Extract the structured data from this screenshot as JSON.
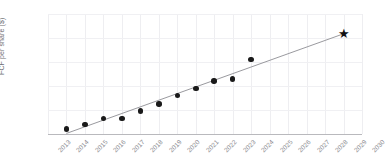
{
  "chart_data": {
    "type": "scatter",
    "title": "",
    "xlabel": "",
    "ylabel": "FCF per share ($)",
    "xlim": [
      2013,
      2030
    ],
    "ylim": [
      0,
      10
    ],
    "grid": true,
    "legend": false,
    "xticks": [
      "2013",
      "2014",
      "2015",
      "2016",
      "2017",
      "2018",
      "2019",
      "2020",
      "2021",
      "2022",
      "2023",
      "2024",
      "2025",
      "2026",
      "2027",
      "2028",
      "2029",
      "2030"
    ],
    "yticks": [
      "0",
      "2",
      "4",
      "6",
      "8",
      "10"
    ],
    "ytick_values": [
      0,
      2,
      4,
      6,
      8,
      10
    ],
    "series": [
      {
        "name": "Historical FCF per share",
        "marker": "circle",
        "color": "#1a1a1a",
        "x": [
          2014,
          2015,
          2016,
          2017,
          2018,
          2019,
          2020,
          2021,
          2022,
          2023,
          2024
        ],
        "values": [
          0.4,
          0.8,
          1.3,
          1.3,
          1.9,
          2.5,
          3.2,
          3.8,
          4.4,
          4.6,
          6.2
        ]
      },
      {
        "name": "Projected FCF per share",
        "marker": "star",
        "color": "#111111",
        "x": [
          2029
        ],
        "values": [
          8.3
        ]
      },
      {
        "name": "Trend line",
        "marker": "line",
        "color": "#9a9a9f",
        "x": [
          2014,
          2029
        ],
        "values": [
          0.05,
          8.35
        ]
      }
    ],
    "annotations": []
  }
}
